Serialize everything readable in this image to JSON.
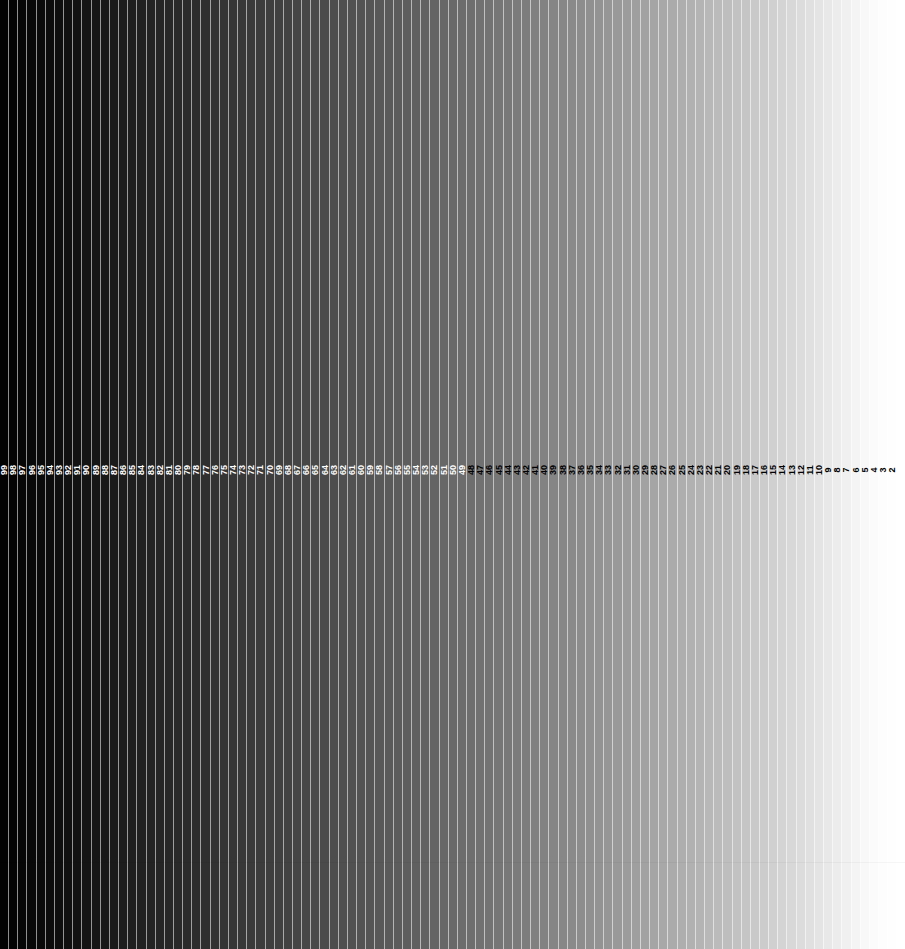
{
  "chart_data": {
    "type": "bar",
    "subtitle": "",
    "xlabel": "",
    "ylabel": "",
    "grid": false,
    "legend_position": "none",
    "orientation": "vertical-bands",
    "label_text_rotation_deg": -90,
    "label_row_center_y": 470,
    "separator_color": "#ffffff",
    "dark_label_color": "#000000",
    "light_label_color": "#ffffff",
    "label_color_flip_step": 48,
    "categories": [
      99,
      98,
      97,
      96,
      95,
      94,
      93,
      92,
      91,
      90,
      89,
      88,
      87,
      86,
      85,
      84,
      83,
      82,
      81,
      80,
      79,
      78,
      77,
      76,
      75,
      74,
      73,
      72,
      71,
      70,
      69,
      68,
      67,
      66,
      65,
      64,
      63,
      62,
      61,
      60,
      59,
      58,
      57,
      56,
      55,
      54,
      53,
      52,
      51,
      50,
      49,
      48,
      47,
      46,
      45,
      44,
      43,
      42,
      41,
      40,
      39,
      38,
      37,
      36,
      35,
      34,
      33,
      32,
      31,
      30,
      29,
      28,
      27,
      26,
      25,
      24,
      23,
      22,
      21,
      20,
      19,
      18,
      17,
      16,
      15,
      14,
      13,
      12,
      11,
      10,
      9,
      8,
      7,
      6,
      5,
      4,
      3,
      2,
      1
    ],
    "values": [
      2,
      4,
      6,
      8,
      10,
      12,
      14,
      16,
      18,
      20,
      22,
      24,
      26,
      29,
      31,
      33,
      35,
      37,
      39,
      41,
      43,
      45,
      47,
      50,
      52,
      54,
      56,
      58,
      60,
      62,
      64,
      66,
      69,
      71,
      73,
      75,
      77,
      79,
      81,
      83,
      85,
      88,
      90,
      92,
      94,
      96,
      98,
      100,
      103,
      105,
      108,
      110,
      113,
      115,
      118,
      120,
      123,
      125,
      128,
      130,
      133,
      135,
      138,
      141,
      144,
      147,
      150,
      153,
      156,
      159,
      162,
      165,
      168,
      171,
      174,
      177,
      180,
      184,
      187,
      190,
      194,
      197,
      201,
      204,
      208,
      212,
      216,
      220,
      224,
      228,
      232,
      236,
      240,
      244,
      248,
      251,
      253,
      254,
      255
    ],
    "ylim": [
      0,
      255
    ],
    "xlim": [
      0,
      99
    ],
    "value_unit": "8-bit luminance"
  }
}
